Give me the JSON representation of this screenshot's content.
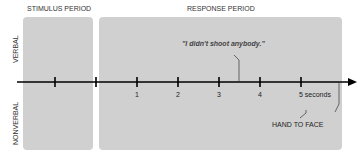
{
  "headers": {
    "stimulus": "STIMULUS PERIOD",
    "response": "RESPONSE PERIOD"
  },
  "row_labels": {
    "verbal": "VERBAL",
    "nonverbal": "NONVERBAL"
  },
  "timeline": {
    "tick_labels": [
      "1",
      "2",
      "3",
      "4",
      "5 seconds"
    ],
    "tick_count": 7
  },
  "annotations": {
    "verbal_event": "\"I didn't shoot anybody.\"",
    "nonverbal_event": "HAND TO FACE"
  }
}
